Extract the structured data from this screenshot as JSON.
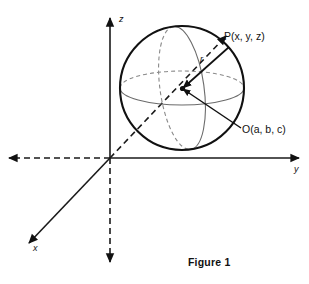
{
  "figure": {
    "caption": "Figure 1",
    "axes": [
      {
        "name": "z-axis",
        "label": "z"
      },
      {
        "name": "y-axis",
        "label": "y"
      },
      {
        "name": "x-axis",
        "label": "x"
      }
    ],
    "labels": {
      "point_p": "P(x, y, z)",
      "center_o": "O(a, b, c)",
      "radius": "r"
    },
    "colors": {
      "ink": "#111111",
      "equator": "#6b6b6b",
      "hidden": "#8a8a8a",
      "background": "#ffffff"
    },
    "geometry": {
      "origin": "(110, 158)",
      "sphere_center": "(182, 88)",
      "sphere_radius": "62"
    }
  }
}
